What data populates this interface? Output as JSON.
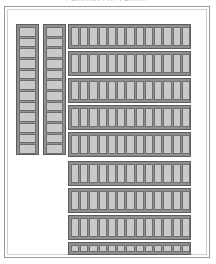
{
  "document": {
    "caption": "PARKING LOT LAYOUT",
    "caption_legible": false
  },
  "frame": {
    "style": "double-line-border",
    "outer_color": "#9a9a9a",
    "inner_color": "#cfcfcf",
    "background": "#ffffff"
  },
  "palette": {
    "stall_fill": "#c9c9c9",
    "stall_stroke": "#6f6f6f",
    "bank_fill": "#8f8f8f",
    "bank_stroke": "#5d5d5d",
    "page_background": "#ffffff"
  },
  "plan": {
    "title": "Parking stall plan",
    "orientation": "portrait",
    "left_banks": [
      {
        "id": "left-bank-1",
        "name": "west-column-a",
        "orientation": "vertical",
        "stall_orientation": "horizontal",
        "x": 16,
        "y": 24,
        "w": 23,
        "h": 131,
        "stall_count": 12
      },
      {
        "id": "left-bank-2",
        "name": "west-column-b",
        "orientation": "vertical",
        "stall_orientation": "horizontal",
        "x": 43,
        "y": 24,
        "w": 23,
        "h": 131,
        "stall_count": 12
      }
    ],
    "right_rows": [
      {
        "id": "row-1",
        "name": "aisle-row-1",
        "x": 68,
        "y": 24,
        "w": 123,
        "h": 25,
        "stall_count": 13
      },
      {
        "id": "row-2",
        "name": "aisle-row-2",
        "x": 68,
        "y": 51,
        "w": 123,
        "h": 25,
        "stall_count": 13
      },
      {
        "id": "row-3",
        "name": "aisle-row-3",
        "x": 68,
        "y": 78,
        "w": 123,
        "h": 25,
        "stall_count": 13
      },
      {
        "id": "row-4",
        "name": "aisle-row-4",
        "x": 68,
        "y": 105,
        "w": 123,
        "h": 25,
        "stall_count": 13
      },
      {
        "id": "row-5",
        "name": "aisle-row-5",
        "x": 68,
        "y": 132,
        "w": 123,
        "h": 25,
        "stall_count": 13
      },
      {
        "id": "row-6",
        "name": "aisle-row-6",
        "x": 68,
        "y": 161,
        "w": 123,
        "h": 25,
        "stall_count": 13
      },
      {
        "id": "row-7",
        "name": "aisle-row-7",
        "x": 68,
        "y": 188,
        "w": 123,
        "h": 25,
        "stall_count": 13
      },
      {
        "id": "row-8",
        "name": "aisle-row-8",
        "x": 68,
        "y": 215,
        "w": 123,
        "h": 25,
        "stall_count": 13
      },
      {
        "id": "row-9",
        "name": "aisle-row-9",
        "x": 68,
        "y": 242,
        "w": 123,
        "h": 13,
        "stall_count": 13
      }
    ],
    "totals": {
      "left_stalls": 24,
      "right_stalls": 117,
      "all_stalls": 141
    }
  }
}
